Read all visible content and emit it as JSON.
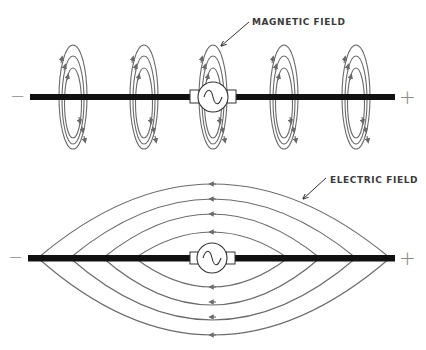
{
  "diagram": {
    "colors": {
      "background": "#ffffff",
      "wire": "#111111",
      "field_lines": "#6a6a6a",
      "labels": "#3a3a3a",
      "signs": "#8a8a8a"
    },
    "top_panel": {
      "label": "MAGNETIC FIELD",
      "negative_sign": "−",
      "positive_sign": "+",
      "source_icon": "ac-generator-icon",
      "loop_count": 5
    },
    "bottom_panel": {
      "label": "ELECTRIC FIELD",
      "negative_sign": "−",
      "positive_sign": "+",
      "source_icon": "ac-generator-icon",
      "field_line_pairs": 4
    }
  }
}
